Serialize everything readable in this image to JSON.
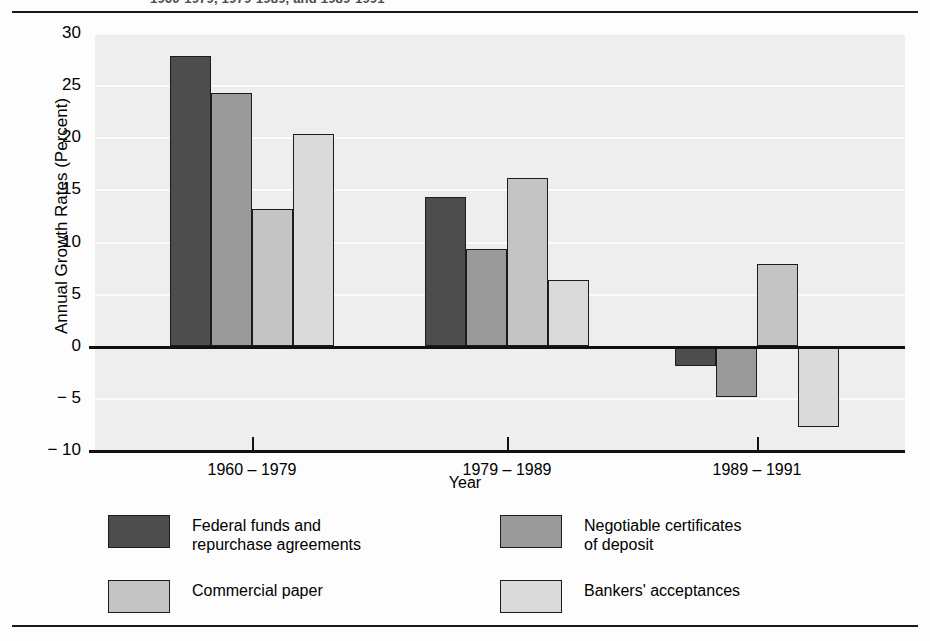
{
  "figure": {
    "clipped_title": "1960-1979, 1979-1989, and 1989-1991"
  },
  "chart_data": {
    "type": "bar",
    "title": "",
    "xlabel": "Year",
    "ylabel": "Annual Growth Rates (Percent)",
    "categories": [
      "1960 – 1979",
      "1979 – 1989",
      "1989 – 1991"
    ],
    "ylim": [
      -10,
      30
    ],
    "yticks": [
      30,
      25,
      20,
      15,
      10,
      5,
      0,
      -5,
      -10
    ],
    "ytick_labels": [
      "30",
      "25",
      "20",
      "15",
      "10",
      "5",
      "0",
      "− 5",
      "− 10"
    ],
    "grid": true,
    "legend_position": "below",
    "series": [
      {
        "name": "Federal funds and\nrepurchase agreements",
        "color": "#4d4d4d",
        "values": [
          27.8,
          14.3,
          -1.9
        ]
      },
      {
        "name": "Negotiable certificates\nof deposit",
        "color": "#9a9a9a",
        "values": [
          24.2,
          9.3,
          -4.9
        ]
      },
      {
        "name": "Commercial paper",
        "color": "#c4c4c4",
        "values": [
          13.1,
          16.1,
          7.8
        ]
      },
      {
        "name": "Bankers' acceptances",
        "color": "#dadada",
        "values": [
          20.3,
          6.3,
          -7.8
        ]
      }
    ]
  },
  "colors": {
    "plot_background": "#efeeee",
    "gridline": "#fbfbfb",
    "axis": "#111111",
    "page_background": "#fdfdfd"
  }
}
